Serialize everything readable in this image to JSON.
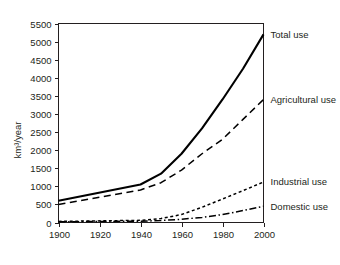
{
  "figure": {
    "y_axis_title": "km3/year",
    "y_axis_title_display": "km³/year"
  },
  "chart_data": {
    "type": "line",
    "title": "",
    "xlabel": "",
    "ylabel": "km³/year",
    "xlim": [
      1900,
      2000
    ],
    "ylim": [
      0,
      5500
    ],
    "grid": false,
    "legend_position": "right-inline",
    "x": [
      1900,
      1940,
      1950,
      1960,
      1970,
      1980,
      1990,
      2000
    ],
    "xticks": [
      1900,
      1920,
      1940,
      1960,
      1980,
      2000
    ],
    "xtick_labels": [
      "1900",
      "1920",
      "1940",
      "1960",
      "1980",
      "2000"
    ],
    "yticks": [
      0,
      500,
      1000,
      1500,
      2000,
      2500,
      3000,
      3500,
      4000,
      4500,
      5000,
      5500
    ],
    "ytick_labels": [
      "0",
      "500",
      "1000",
      "1500",
      "2000",
      "2500",
      "3000",
      "3500",
      "4000",
      "4500",
      "5000",
      "5500"
    ],
    "series": [
      {
        "name": "Total use",
        "label": "Total use",
        "style": "solid",
        "values": [
          600,
          1050,
          1350,
          1900,
          2600,
          3400,
          4250,
          5200
        ]
      },
      {
        "name": "Agricultural use",
        "label": "Agricultural use",
        "style": "dashed",
        "values": [
          500,
          900,
          1100,
          1450,
          1900,
          2300,
          2850,
          3400
        ]
      },
      {
        "name": "Industrial use",
        "label": "Industrial use",
        "style": "dotted",
        "values": [
          30,
          60,
          110,
          220,
          420,
          650,
          880,
          1120
        ]
      },
      {
        "name": "Domestic use",
        "label": "Domestic use",
        "style": "dash-dot",
        "values": [
          20,
          35,
          55,
          90,
          140,
          220,
          330,
          450
        ]
      }
    ]
  }
}
